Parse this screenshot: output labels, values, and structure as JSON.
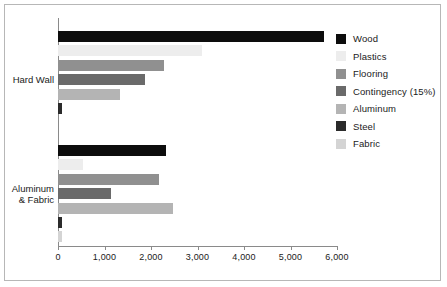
{
  "chart_data": {
    "type": "bar",
    "orientation": "horizontal",
    "title": "",
    "xlabel": "",
    "ylabel": "",
    "xlim": [
      0,
      6000
    ],
    "grid": false,
    "legend_position": "right",
    "categories": [
      "Hard Wall",
      "Aluminum\n& Fabric"
    ],
    "x_ticks": [
      0,
      1000,
      2000,
      3000,
      4000,
      5000,
      6000
    ],
    "x_tick_labels": [
      "0",
      "1,000",
      "2,000",
      "3,000",
      "4,000",
      "5,000",
      "6,000"
    ],
    "series": [
      {
        "name": "Wood",
        "color": "#0d0d0d",
        "values": [
          5715,
          2320
        ]
      },
      {
        "name": "Plastics",
        "color": "#ededed",
        "values": [
          3090,
          540
        ]
      },
      {
        "name": "Flooring",
        "color": "#909090",
        "values": [
          2290,
          2170
        ]
      },
      {
        "name": "Contingency (15%)",
        "color": "#6a6a6a",
        "values": [
          1880,
          1150
        ]
      },
      {
        "name": "Aluminum",
        "color": "#b4b4b4",
        "values": [
          1330,
          2470
        ]
      },
      {
        "name": "Steel",
        "color": "#2b2b2b",
        "values": [
          90,
          90
        ]
      },
      {
        "name": "Fabric",
        "color": "#d4d4d4",
        "values": [
          0,
          80
        ]
      }
    ]
  },
  "legend": {
    "items": [
      {
        "label": "Wood",
        "color": "#0d0d0d"
      },
      {
        "label": "Plastics",
        "color": "#ededed"
      },
      {
        "label": "Flooring",
        "color": "#909090"
      },
      {
        "label": "Contingency (15%)",
        "color": "#6a6a6a"
      },
      {
        "label": "Aluminum",
        "color": "#b4b4b4"
      },
      {
        "label": "Steel",
        "color": "#2b2b2b"
      },
      {
        "label": "Fabric",
        "color": "#d4d4d4"
      }
    ]
  },
  "axes": {
    "category_labels": [
      "Hard Wall",
      "Aluminum\n& Fabric"
    ],
    "value_tick_labels": [
      "0",
      "1,000",
      "2,000",
      "3,000",
      "4,000",
      "5,000",
      "6,000"
    ]
  },
  "colors": {
    "frame": "#b7b7b7",
    "axis": "#8a8a8a",
    "text": "#1a1a1a",
    "background": "#ffffff"
  }
}
